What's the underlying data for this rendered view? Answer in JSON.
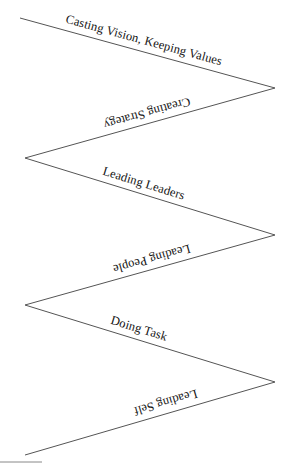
{
  "diagram": {
    "type": "zigzag-leadership-levels",
    "background_color": "#ffffff",
    "line_color": "#555555",
    "text_color": "#141414",
    "segments": [
      {
        "label": "Casting Vision, Keeping Values",
        "direction": "descending",
        "index": 1
      },
      {
        "label": "Creating Strategy",
        "direction": "ascending",
        "index": 2
      },
      {
        "label": "Leading Leaders",
        "direction": "descending",
        "index": 3
      },
      {
        "label": "Leading People",
        "direction": "ascending",
        "index": 4
      },
      {
        "label": "Doing Task",
        "direction": "descending",
        "index": 5
      },
      {
        "label": "Leading Self",
        "direction": "ascending",
        "index": 6
      }
    ],
    "path_points": "20,18 275,88 25,158 275,235 25,305 275,382 25,455",
    "footnote_rule": {
      "x1": 0,
      "y1": 462,
      "x2": 42,
      "y2": 462
    }
  }
}
